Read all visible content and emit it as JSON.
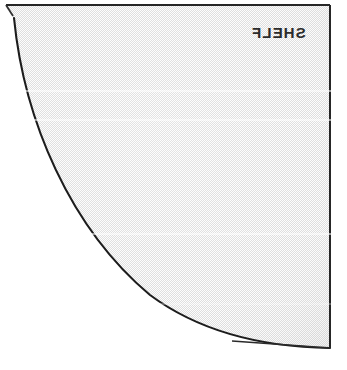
{
  "figure": {
    "caption": "SHELF",
    "caption_mirrored": true,
    "kind": "quarter-round-shelf-plan",
    "fill_style": "dithered-halftone-gray",
    "colors": {
      "paper": "#ffffff",
      "fill_gray": "#d2d2d2",
      "fill_dither_light": "#ffffff",
      "outline": "#1c1c1c",
      "caption_text": "#2b2b2b",
      "scan_band": "#ffffff"
    },
    "geometry": {
      "note": "Quarter circle whose straight edges are the top and right borders; the curved edge (radius edge) sweeps from the upper-left down to the lower-right.",
      "frame": {
        "top_y": 5,
        "right_x": 330,
        "bottom_y": 348,
        "left_x": 5
      },
      "arc_points": [
        {
          "x": 14,
          "y": 18
        },
        {
          "x": 20,
          "y": 60
        },
        {
          "x": 28,
          "y": 110
        },
        {
          "x": 37,
          "y": 150
        },
        {
          "x": 55,
          "y": 195
        },
        {
          "x": 75,
          "y": 228
        },
        {
          "x": 95,
          "y": 250
        },
        {
          "x": 118,
          "y": 271
        },
        {
          "x": 140,
          "y": 288
        },
        {
          "x": 172,
          "y": 310
        },
        {
          "x": 200,
          "y": 326
        },
        {
          "x": 232,
          "y": 341
        },
        {
          "x": 262,
          "y": 346
        },
        {
          "x": 330,
          "y": 348
        }
      ]
    },
    "scan_bands_y": [
      90,
      119,
      233,
      303
    ]
  }
}
